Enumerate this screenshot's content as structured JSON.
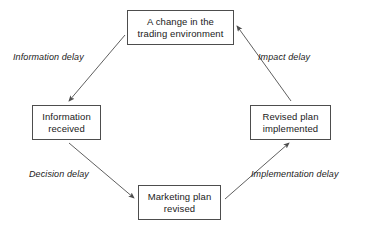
{
  "diagram": {
    "background_color": "#ffffff",
    "line_color": "#4d4d4d",
    "text_color": "#1a1a1a",
    "nodes": [
      {
        "id": "change",
        "label": "A change in the trading environment"
      },
      {
        "id": "info",
        "label": "Information received"
      },
      {
        "id": "revised",
        "label": "Marketing plan revised"
      },
      {
        "id": "plan",
        "label": "Revised plan implemented"
      }
    ],
    "edges": [
      {
        "id": "information-delay",
        "label": "Information delay",
        "from": "change",
        "to": "info"
      },
      {
        "id": "decision-delay",
        "label": "Decision delay",
        "from": "info",
        "to": "revised"
      },
      {
        "id": "implementation-delay",
        "label": "Implementation delay",
        "from": "revised",
        "to": "plan"
      },
      {
        "id": "impact-delay",
        "label": "Impact delay",
        "from": "plan",
        "to": "change"
      }
    ]
  }
}
